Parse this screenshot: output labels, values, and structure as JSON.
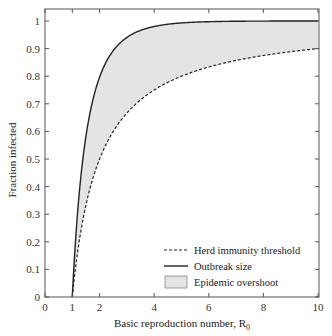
{
  "chart_data": {
    "type": "area",
    "title": "",
    "xlabel": "Basic reproduction number, R",
    "xlabel_subscript": "0",
    "ylabel": "Fraction infected",
    "xlim": [
      0,
      10
    ],
    "ylim": [
      0,
      1.05
    ],
    "x_ticks": [
      0,
      1,
      2,
      4,
      6,
      8,
      10
    ],
    "y_ticks": [
      0,
      0.1,
      0.2,
      0.3,
      0.4,
      0.5,
      0.6,
      0.7,
      0.8,
      0.9,
      1
    ],
    "x_tick_labels": [
      "0",
      "1",
      "2",
      "4",
      "6",
      "8",
      "10"
    ],
    "y_tick_labels": [
      "0",
      "0.1",
      "0.2",
      "0.3",
      "0.4",
      "0.5",
      "0.6",
      "0.7",
      "0.8",
      "0.9",
      "1"
    ],
    "grid": false,
    "legend_position": "lower right",
    "x": [
      1,
      1.1,
      1.2,
      1.3,
      1.4,
      1.5,
      1.75,
      2,
      2.5,
      3,
      3.5,
      4,
      5,
      6,
      7,
      8,
      9,
      10
    ],
    "series": [
      {
        "name": "Herd immunity threshold",
        "style": "dashed",
        "values": [
          0,
          0.091,
          0.167,
          0.231,
          0.286,
          0.333,
          0.429,
          0.5,
          0.6,
          0.667,
          0.714,
          0.75,
          0.8,
          0.833,
          0.857,
          0.875,
          0.889,
          0.9
        ]
      },
      {
        "name": "Outbreak size",
        "style": "solid",
        "values": [
          0,
          0.176,
          0.314,
          0.424,
          0.511,
          0.583,
          0.705,
          0.797,
          0.893,
          0.94,
          0.966,
          0.98,
          0.993,
          0.9975,
          0.9991,
          0.9997,
          0.9999,
          1.0
        ]
      },
      {
        "name": "Epidemic overshoot",
        "style": "fill-between",
        "color": "#e4e4e4"
      }
    ]
  },
  "legend": {
    "items": [
      {
        "label": "Herd immunity threshold",
        "style": "dashed"
      },
      {
        "label": "Outbreak size",
        "style": "solid"
      },
      {
        "label": "Epidemic overshoot",
        "style": "fill"
      }
    ]
  },
  "colors": {
    "line": "#222222",
    "fill": "#e4e4e4",
    "axis": "#333333"
  }
}
